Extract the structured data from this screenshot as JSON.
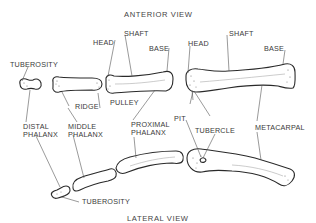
{
  "titles": {
    "top": "ANTERIOR VIEW",
    "bottom": "LATERAL VIEW"
  },
  "anterior_labels": {
    "tuberosity": "TUBEROSITY",
    "head_1": "HEAD",
    "shaft_1": "SHAFT",
    "base_1": "BASE",
    "head_2": "HEAD",
    "shaft_2": "SHAFT",
    "base_2": "BASE",
    "ridge": "RIDGE",
    "pulley": "PULLEY"
  },
  "bone_labels": {
    "distal_phalanx": "DISTAL\nPHALANX",
    "middle_phalanx": "MIDDLE\nPHALANX",
    "proximal_phalanx": "PROXIMAL\nPHALANX",
    "pit": "PIT",
    "tubercle": "TUBERCLE",
    "metacarpal": "METACARPAL"
  },
  "lateral_labels": {
    "tuberosity": "TUBEROSITY"
  }
}
